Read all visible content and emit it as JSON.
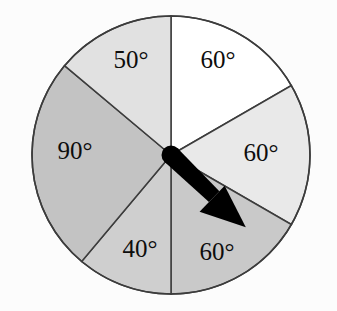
{
  "figure": {
    "kind": "spinner-wheel",
    "background_color": "#fcfcfc",
    "outline_color": "#3c3c3c",
    "hub_color": "#000000",
    "pointer_color": "#000000",
    "pointer_direction_deg": 134,
    "center": {
      "x": 171,
      "y": 155
    },
    "radius": 139
  },
  "chart_data": {
    "type": "pie",
    "title": "",
    "xlabel": "",
    "ylabel": "",
    "grid": false,
    "legend": "none",
    "unit": "degrees",
    "total_degrees": 360,
    "rotation_start_deg": 0,
    "direction": "clockwise",
    "categories": [
      "60°",
      "60°",
      "60°",
      "40°",
      "90°",
      "50°"
    ],
    "values": [
      60,
      60,
      60,
      40,
      90,
      50
    ],
    "slices": [
      {
        "label": "60°",
        "value": 60,
        "start_deg": 0,
        "end_deg": 60,
        "fill": "#ffffff",
        "label_x": 218,
        "label_y": 62,
        "pointed_at": false
      },
      {
        "label": "60°",
        "value": 60,
        "start_deg": 60,
        "end_deg": 120,
        "fill": "#e9e9e9",
        "label_x": 261,
        "label_y": 155,
        "pointed_at": false
      },
      {
        "label": "60°",
        "value": 60,
        "start_deg": 120,
        "end_deg": 180,
        "fill": "#c9c9c9",
        "label_x": 217,
        "label_y": 254,
        "pointed_at": true
      },
      {
        "label": "40°",
        "value": 40,
        "start_deg": 180,
        "end_deg": 220,
        "fill": "#cfcfcf",
        "label_x": 140,
        "label_y": 251,
        "pointed_at": false
      },
      {
        "label": "90°",
        "value": 90,
        "start_deg": 220,
        "end_deg": 310,
        "fill": "#c3c3c3",
        "label_x": 75,
        "label_y": 153,
        "pointed_at": false
      },
      {
        "label": "50°",
        "value": 50,
        "start_deg": 310,
        "end_deg": 360,
        "fill": "#e1e1e1",
        "label_x": 131,
        "label_y": 62,
        "pointed_at": false
      }
    ]
  }
}
